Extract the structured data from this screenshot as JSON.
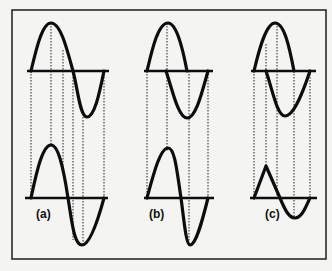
{
  "figure": {
    "colors": {
      "ink": "#0d0d0d",
      "background": "#f4f4f2",
      "frame": "#2a2a2a"
    }
  },
  "panels": [
    {
      "label": "(a)",
      "top_wave": "sine",
      "bottom_wave": "sine with sharpened zero crossing (steep descent)"
    },
    {
      "label": "(b)",
      "top_wave": "sine",
      "bottom_wave": "skewed sine, peak shifted right, large negative lobe"
    },
    {
      "label": "(c)",
      "top_wave": "sine",
      "bottom_wave": "triangular positive pulse followed by small negative lobe"
    }
  ]
}
